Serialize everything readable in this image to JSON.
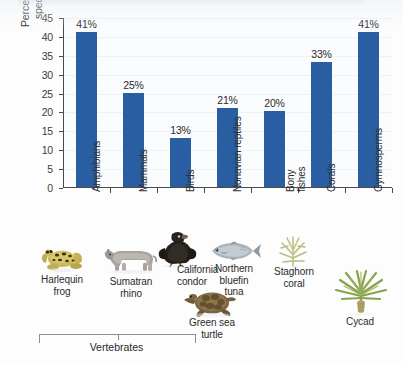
{
  "chart_data": {
    "type": "bar",
    "title": "",
    "xlabel": "",
    "ylabel": "Percentage of threatened species in each group",
    "ylabel_line1": "Percentage of threatened",
    "ylabel_line2": "species in each group",
    "ylim": [
      0,
      45
    ],
    "yticks": [
      0,
      5,
      10,
      15,
      20,
      25,
      30,
      35,
      40,
      45
    ],
    "grid": true,
    "legend": "none",
    "bar_color": "#2a5ea2",
    "categories": [
      "Amphibians",
      "Mammals",
      "Birds",
      "Nonavian reptiles",
      "Bony fishes",
      "Corals",
      "Gymnosperms"
    ],
    "values": [
      41,
      25,
      13,
      21,
      20,
      33,
      41
    ],
    "value_labels": [
      "41%",
      "25%",
      "13%",
      "21%",
      "20%",
      "33%",
      "41%"
    ],
    "group_bracket": {
      "label": "Vertebrates",
      "spans_categories": [
        "Amphibians",
        "Mammals",
        "Birds",
        "Nonavian reptiles",
        "Bony fishes"
      ]
    }
  },
  "axis": {
    "y_tick_labels": [
      "0",
      "5",
      "10",
      "15",
      "20",
      "25",
      "30",
      "35",
      "40",
      "45"
    ]
  },
  "category_labels": [
    {
      "text": "Amphibians",
      "lines": [
        "Amphibians"
      ]
    },
    {
      "text": "Mammals",
      "lines": [
        "Mammals"
      ]
    },
    {
      "text": "Birds",
      "lines": [
        "Birds"
      ]
    },
    {
      "text": "Nonavian reptiles",
      "lines": [
        "Nonavian reptiles"
      ]
    },
    {
      "text": "Bony fishes",
      "lines": [
        "Bony",
        "fishes"
      ]
    },
    {
      "text": "Corals",
      "lines": [
        "Corals"
      ]
    },
    {
      "text": "Gymnosperms",
      "lines": [
        "Gymnosperms"
      ]
    }
  ],
  "specimens": [
    {
      "name": "harlequin-frog",
      "caption_line1": "Harlequin",
      "caption_line2": "frog",
      "icon": "frog-photo"
    },
    {
      "name": "sumatran-rhino",
      "caption_line1": "Sumatran",
      "caption_line2": "rhino",
      "icon": "rhino-photo"
    },
    {
      "name": "california-condor",
      "caption_line1": "California",
      "caption_line2": "condor",
      "icon": "condor-photo"
    },
    {
      "name": "green-sea-turtle",
      "caption_line1": "Green sea",
      "caption_line2": "turtle",
      "icon": "turtle-photo"
    },
    {
      "name": "northern-bluefin-tuna",
      "caption_line1": "Northern",
      "caption_line2": "bluefin",
      "caption_line3": "tuna",
      "icon": "tuna-photo"
    },
    {
      "name": "staghorn-coral",
      "caption_line1": "Staghorn",
      "caption_line2": "coral",
      "icon": "coral-photo"
    },
    {
      "name": "cycad",
      "caption_line1": "Cycad",
      "caption_line2": "",
      "icon": "cycad-photo"
    }
  ],
  "bracket": {
    "label": "Vertebrates"
  }
}
